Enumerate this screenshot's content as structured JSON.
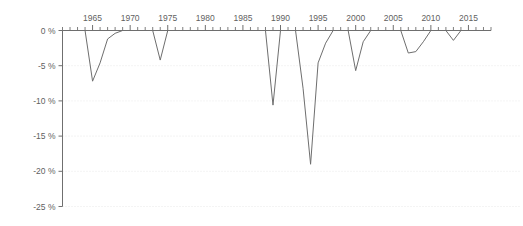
{
  "chart_data": {
    "type": "line",
    "title": "",
    "subtitle": "",
    "xlabel": "",
    "ylabel": "",
    "xlim": [
      1961,
      2018
    ],
    "ylim": [
      -25,
      0
    ],
    "grid": true,
    "legend": "none",
    "colors": {
      "line": "#6e6e6e",
      "axis": "#6f6f6f",
      "grid": "#e3e3e3",
      "text": "#5f5f5f",
      "background": "#ffffff"
    },
    "y_tick_labels": [
      "0 %",
      "-5 %",
      "-10 %",
      "-15 %",
      "-20 %",
      "-25 %"
    ],
    "y_tick_values": [
      0,
      -5,
      -10,
      -15,
      -20,
      -25
    ],
    "x_tick_labels": [
      "1965",
      "1970",
      "1975",
      "1980",
      "1985",
      "1990",
      "1995",
      "2000",
      "2005",
      "2010",
      "2015"
    ],
    "x_tick_values": [
      1965,
      1970,
      1975,
      1980,
      1985,
      1990,
      1995,
      2000,
      2005,
      2010,
      2015
    ],
    "x_minor_tick_step": 1,
    "series": [
      {
        "name": "Drawdown",
        "x": [
          1961,
          1962,
          1963,
          1964,
          1965,
          1966,
          1967,
          1968,
          1969,
          1970,
          1971,
          1972,
          1973,
          1974,
          1975,
          1976,
          1977,
          1978,
          1979,
          1980,
          1981,
          1982,
          1983,
          1984,
          1985,
          1986,
          1987,
          1988,
          1989,
          1990,
          1991,
          1992,
          1993,
          1994,
          1995,
          1996,
          1997,
          1998,
          1999,
          2000,
          2001,
          2002,
          2003,
          2004,
          2005,
          2006,
          2007,
          2008,
          2009,
          2010,
          2011,
          2012,
          2013,
          2014,
          2015,
          2016,
          2017,
          2018
        ],
        "values": [
          0,
          0,
          0,
          0,
          -7.2,
          -4.6,
          -1.2,
          -0.4,
          0,
          0,
          0,
          0,
          0,
          -4.2,
          0,
          0,
          0,
          0,
          0,
          0,
          0,
          0,
          0,
          0,
          0,
          0,
          0,
          0,
          -10.6,
          0,
          0,
          0,
          -8.2,
          -19.0,
          -4.6,
          -1.8,
          0,
          0,
          0,
          -5.7,
          -1.6,
          0,
          0,
          0,
          0,
          0,
          -3.2,
          -3.0,
          -1.6,
          0,
          0,
          0,
          -1.4,
          0,
          0,
          0,
          0,
          0
        ]
      }
    ]
  },
  "axis": {
    "y_unit": "%",
    "x_unit": "year"
  }
}
